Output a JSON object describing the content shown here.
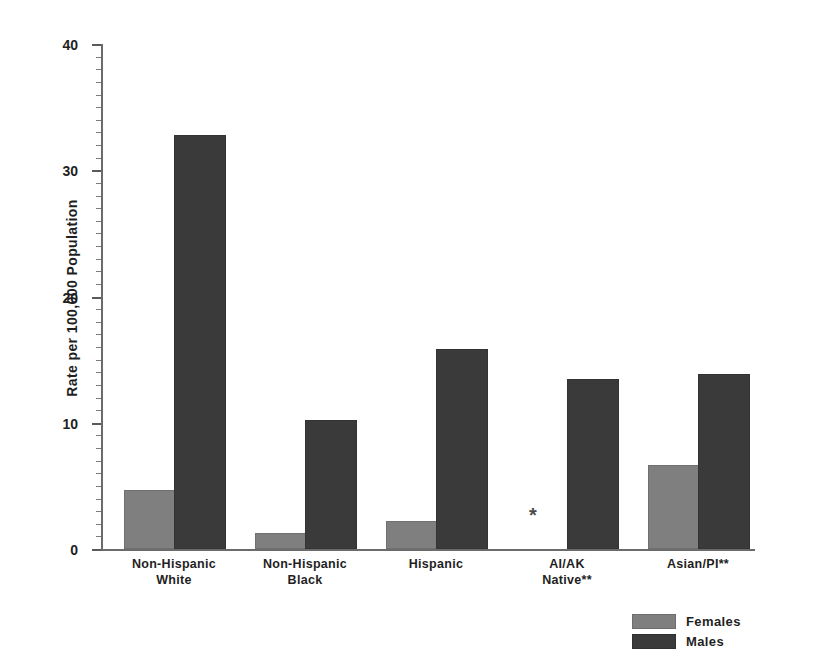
{
  "chart_data": {
    "type": "bar",
    "title": "",
    "xlabel": "",
    "ylabel": "Rate per 100,000 Population",
    "ylim": [
      0,
      40
    ],
    "ytick_labels": [
      "0",
      "10",
      "20",
      "30",
      "40"
    ],
    "ytick_values": [
      0,
      10,
      20,
      30,
      40
    ],
    "minor_tick_interval": 1,
    "grid": false,
    "legend_position": "bottom-right",
    "categories": [
      "Non-Hispanic\nWhite",
      "Non-Hispanic\nBlack",
      "Hispanic",
      "AI/AK\nNative**",
      "Asian/PI**"
    ],
    "category_lines": [
      [
        "Non-Hispanic",
        "White"
      ],
      [
        "Non-Hispanic",
        "Black"
      ],
      [
        "Hispanic",
        ""
      ],
      [
        "AI/AK",
        "Native**"
      ],
      [
        "Asian/PI**",
        ""
      ]
    ],
    "series": [
      {
        "name": "Females",
        "color": "#7f7f7f",
        "values": [
          4.5,
          1.1,
          2.1,
          null,
          6.5
        ],
        "value_notes": [
          "",
          "",
          "",
          "*",
          ""
        ]
      },
      {
        "name": "Males",
        "color": "#3a3a3a",
        "values": [
          32.6,
          10.1,
          15.7,
          13.3,
          13.7
        ],
        "value_notes": [
          "",
          "",
          "",
          "",
          ""
        ]
      }
    ],
    "annotations": [
      {
        "text": "*",
        "category": "AI/AK\nNative**",
        "series": "Females",
        "meaning": "suppressed-or-unreliable-estimate"
      }
    ]
  },
  "legend": {
    "items": [
      {
        "label": "Females",
        "color": "#7f7f7f"
      },
      {
        "label": "Males",
        "color": "#3a3a3a"
      }
    ]
  },
  "axis": {
    "y_title": "Rate per 100,000 Population",
    "y_ticks": [
      "40",
      "30",
      "20",
      "10",
      "0"
    ]
  }
}
